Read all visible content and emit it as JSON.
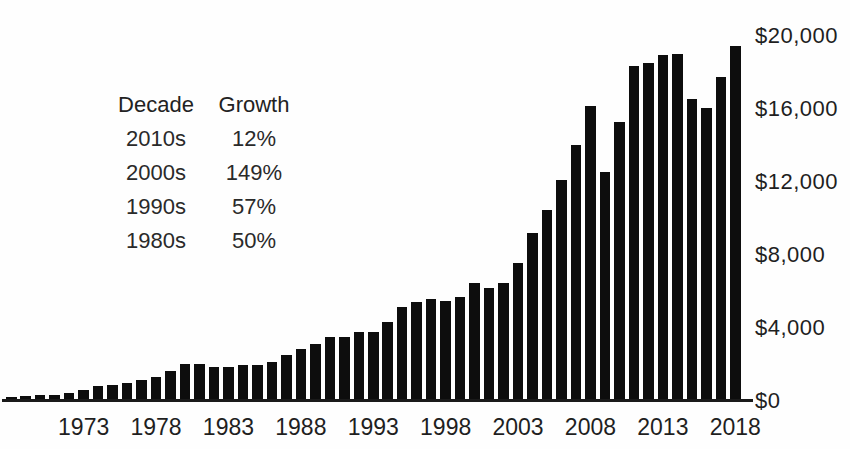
{
  "chart_data": {
    "type": "bar",
    "bar_color": "#0d0d0d",
    "background_color": "#fefefe",
    "ylim": [
      0,
      20000
    ],
    "grid": false,
    "y_axis_side": "right",
    "y_ticks": [
      {
        "value": 0,
        "label": "$0"
      },
      {
        "value": 4000,
        "label": "$4,000"
      },
      {
        "value": 8000,
        "label": "$8,000"
      },
      {
        "value": 12000,
        "label": "$12,000"
      },
      {
        "value": 16000,
        "label": "$16,000"
      },
      {
        "value": 20000,
        "label": "$20,000"
      }
    ],
    "x_ticks": [
      "1973",
      "1978",
      "1983",
      "1988",
      "1993",
      "1998",
      "2003",
      "2008",
      "2013",
      "2018"
    ],
    "years": [
      1968,
      1969,
      1970,
      1971,
      1972,
      1973,
      1974,
      1975,
      1976,
      1977,
      1978,
      1979,
      1980,
      1981,
      1982,
      1983,
      1984,
      1985,
      1986,
      1987,
      1988,
      1989,
      1990,
      1991,
      1992,
      1993,
      1994,
      1995,
      1996,
      1997,
      1998,
      1999,
      2000,
      2001,
      2002,
      2003,
      2004,
      2005,
      2006,
      2007,
      2008,
      2009,
      2010,
      2011,
      2012,
      2013,
      2014,
      2015,
      2016,
      2017,
      2018
    ],
    "values": [
      240,
      273,
      316,
      354,
      419,
      579,
      840,
      877,
      991,
      1128,
      1306,
      1659,
      2049,
      2010,
      1883,
      1846,
      1956,
      1954,
      2138,
      2516,
      2869,
      3098,
      3500,
      3512,
      3766,
      3782,
      4326,
      5164,
      5403,
      5591,
      5501,
      5712,
      6452,
      6191,
      6492,
      7586,
      9218,
      10489,
      12113,
      14003,
      16160,
      12555,
      15301,
      18338,
      18496,
      18948,
      19005,
      16557,
      16042,
      17730,
      19475
    ],
    "annotation_table": {
      "headers": [
        "Decade",
        "Growth"
      ],
      "rows": [
        {
          "decade": "2010s",
          "growth": "12%"
        },
        {
          "decade": "2000s",
          "growth": "149%"
        },
        {
          "decade": "1990s",
          "growth": "57%"
        },
        {
          "decade": "1980s",
          "growth": "50%"
        }
      ]
    }
  }
}
